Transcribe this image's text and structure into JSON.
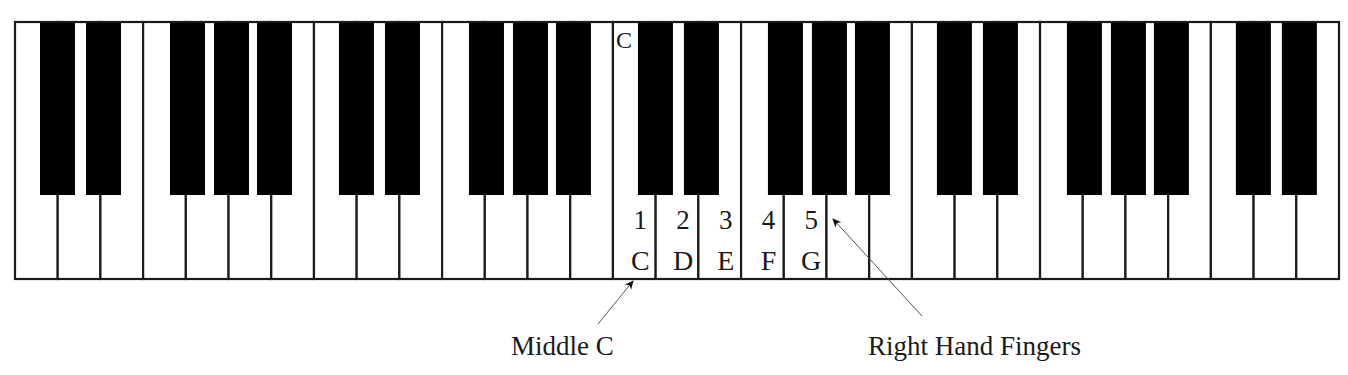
{
  "diagram": {
    "keyboard": {
      "x": 15,
      "y": 22,
      "width": 1324,
      "height": 257,
      "white_key_count": 31,
      "white_key_width": 42.71,
      "black_key_width": 35,
      "black_key_height": 173,
      "start_note": "C",
      "octave_black_offsets": [
        25,
        71,
        155,
        199,
        242
      ],
      "colors": {
        "white_key": "#ffffff",
        "black_key": "#000000",
        "outline": "#1a1a1a"
      }
    },
    "top_marker": {
      "text": "C",
      "white_key_index": 14
    },
    "finger_labels": [
      {
        "finger": "1",
        "note": "C",
        "white_key_index": 14
      },
      {
        "finger": "2",
        "note": "D",
        "white_key_index": 15
      },
      {
        "finger": "3",
        "note": "E",
        "white_key_index": 16
      },
      {
        "finger": "4",
        "note": "F",
        "white_key_index": 17
      },
      {
        "finger": "5",
        "note": "G",
        "white_key_index": 18
      }
    ],
    "callouts": [
      {
        "id": "middle-c",
        "text": "Middle C",
        "text_x": 511,
        "text_y": 333,
        "arrow_from": [
          598,
          324
        ],
        "arrow_to": [
          633,
          281
        ]
      },
      {
        "id": "right-hand-fingers",
        "text": "Right Hand Fingers",
        "text_x": 868,
        "text_y": 333,
        "arrow_from": [
          922,
          316
        ],
        "arrow_to": [
          833,
          219
        ]
      }
    ]
  }
}
